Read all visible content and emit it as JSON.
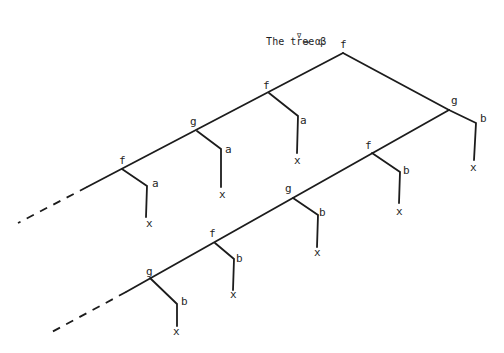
{
  "title": {
    "prefix": "The tree β",
    "superscript": "∇",
    "suffix": "→ α"
  },
  "tree": {
    "root": {
      "label": "f"
    },
    "upper_spine": [
      {
        "label": "f",
        "leaf_label": "a",
        "leaf_end": "x"
      },
      {
        "label": "g",
        "leaf_label": "a",
        "leaf_end": "x"
      },
      {
        "label": "f",
        "leaf_label": "a",
        "leaf_end": "x"
      }
    ],
    "lower_spine": [
      {
        "label": "g",
        "leaf_label": "b",
        "leaf_end": "x"
      },
      {
        "label": "f",
        "leaf_label": "b",
        "leaf_end": "x"
      },
      {
        "label": "g",
        "leaf_label": "b",
        "leaf_end": "x"
      },
      {
        "label": "f",
        "leaf_label": "b",
        "leaf_end": "x"
      },
      {
        "label": "g",
        "leaf_label": "b",
        "leaf_end": "x"
      }
    ],
    "continuation": "dashed"
  }
}
